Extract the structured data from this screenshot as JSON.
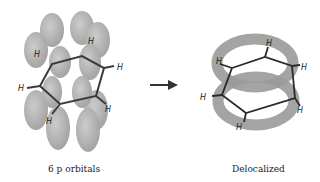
{
  "diagram": {
    "left": {
      "caption": "6 p orbitals",
      "atom_label": "H",
      "hydrogen_count": 6
    },
    "right": {
      "caption": "Delocalized",
      "atom_label": "H",
      "hydrogen_count": 6
    },
    "arrow": "reaction-arrow",
    "colors": {
      "orbital": "#a0a0a0",
      "bond": "#3a3a3a",
      "text": "#222222"
    }
  }
}
